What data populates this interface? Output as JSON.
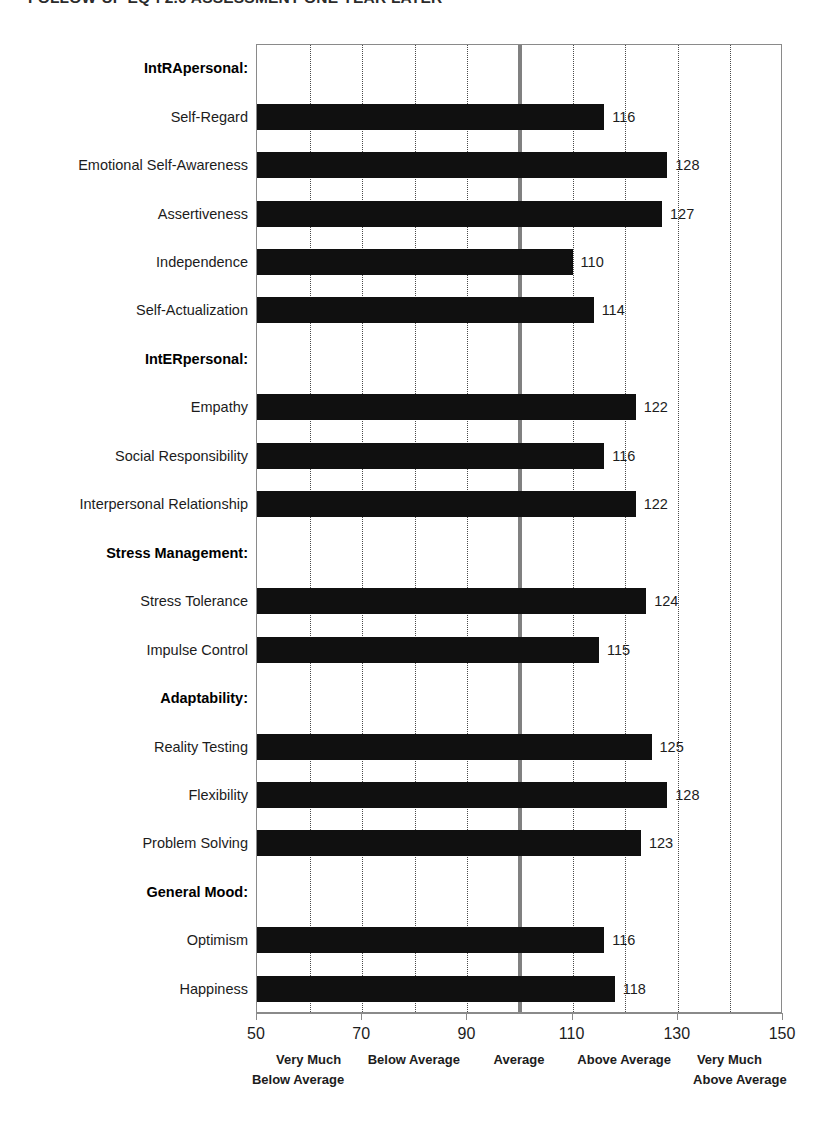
{
  "title": "FOLLOW-UP EQ-i 2.0 ASSESSMENT ONE YEAR LATER",
  "chart_data": {
    "type": "bar",
    "orientation": "horizontal",
    "title": "FOLLOW-UP EQ-i 2.0 ASSESSMENT ONE YEAR LATER",
    "xlabel": "",
    "ylabel": "",
    "xlim": [
      50,
      150
    ],
    "xticks": [
      50,
      70,
      90,
      110,
      130,
      150
    ],
    "xtick_labels": [
      "50",
      "70",
      "90",
      "110",
      "130",
      "150"
    ],
    "minor_gridline_step": 10,
    "grid": true,
    "grid_style": "dotted-vertical",
    "reference_line": {
      "value": 100,
      "label": "Average",
      "color": "#808080"
    },
    "bar_color": "#101010",
    "legend_position": "below-axis",
    "categories": [
      "IntRApersonal:",
      "Self-Regard",
      "Emotional Self-Awareness",
      "Assertiveness",
      "Independence",
      "Self-Actualization",
      "IntERpersonal:",
      "Empathy",
      "Social Responsibility",
      "Interpersonal Relationship",
      "Stress Management:",
      "Stress Tolerance",
      "Impulse Control",
      "Adaptability:",
      "Reality Testing",
      "Flexibility",
      "Problem Solving",
      "General Mood:",
      "Optimism",
      "Happiness"
    ],
    "values": [
      null,
      116,
      128,
      127,
      110,
      114,
      null,
      122,
      116,
      122,
      null,
      124,
      115,
      null,
      125,
      128,
      123,
      null,
      116,
      118
    ],
    "rows": [
      {
        "label": "IntRApersonal:",
        "value": null,
        "is_group": true
      },
      {
        "label": "Self-Regard",
        "value": 116,
        "is_group": false
      },
      {
        "label": "Emotional Self-Awareness",
        "value": 128,
        "is_group": false
      },
      {
        "label": "Assertiveness",
        "value": 127,
        "is_group": false
      },
      {
        "label": "Independence",
        "value": 110,
        "is_group": false
      },
      {
        "label": "Self-Actualization",
        "value": 114,
        "is_group": false
      },
      {
        "label": "IntERpersonal:",
        "value": null,
        "is_group": true
      },
      {
        "label": "Empathy",
        "value": 122,
        "is_group": false
      },
      {
        "label": "Social Responsibility",
        "value": 116,
        "is_group": false
      },
      {
        "label": "Interpersonal Relationship",
        "value": 122,
        "is_group": false
      },
      {
        "label": "Stress Management:",
        "value": null,
        "is_group": true
      },
      {
        "label": "Stress Tolerance",
        "value": 124,
        "is_group": false
      },
      {
        "label": "Impulse Control",
        "value": 115,
        "is_group": false
      },
      {
        "label": "Adaptability:",
        "value": null,
        "is_group": true
      },
      {
        "label": "Reality Testing",
        "value": 125,
        "is_group": false
      },
      {
        "label": "Flexibility",
        "value": 128,
        "is_group": false
      },
      {
        "label": "Problem Solving",
        "value": 123,
        "is_group": false
      },
      {
        "label": "General Mood:",
        "value": null,
        "is_group": true
      },
      {
        "label": "Optimism",
        "value": 116,
        "is_group": false
      },
      {
        "label": "Happiness",
        "value": 118,
        "is_group": false
      }
    ],
    "legend_bands": [
      {
        "text": "Very Much",
        "center": 60,
        "line2": "Below Average",
        "line2_center": 58
      },
      {
        "text": "Below Average",
        "center": 80,
        "line2": null,
        "line2_center": null
      },
      {
        "text": "Average",
        "center": 100,
        "line2": null,
        "line2_center": null
      },
      {
        "text": "Above Average",
        "center": 120,
        "line2": null,
        "line2_center": null
      },
      {
        "text": "Very Much",
        "center": 140,
        "line2": "Above Average",
        "line2_center": 142
      }
    ]
  }
}
